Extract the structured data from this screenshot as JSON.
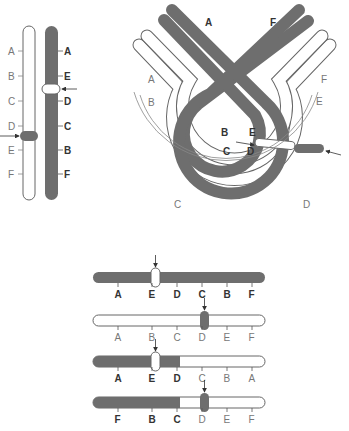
{
  "colors": {
    "dark": "#6e6e6e",
    "light": "#ffffff",
    "stroke": "#555555",
    "label_light": "#888888",
    "label_dark": "#2f2f2f"
  },
  "panel_vertical": {
    "light_chromosome_labels": [
      "A",
      "B",
      "C",
      "D",
      "E",
      "F"
    ],
    "dark_chromosome_labels": [
      "A",
      "E",
      "D",
      "C",
      "B",
      "F"
    ],
    "light_centromere_after": "D",
    "dark_centromere_after": "E"
  },
  "panel_loop": {
    "outer_labels_left": [
      "A",
      "B",
      "C"
    ],
    "outer_labels_right": [
      "F",
      "E",
      "D"
    ],
    "dark_top_labels": [
      "A",
      "F"
    ],
    "inner_loop_labels": [
      "B",
      "E",
      "C",
      "D"
    ]
  },
  "panel_bars": [
    {
      "labels": [
        "A",
        "E",
        "D",
        "C",
        "B",
        "F"
      ],
      "type": "dark",
      "label_style": [
        "b",
        "b",
        "b",
        "b",
        "b",
        "b"
      ]
    },
    {
      "labels": [
        "A",
        "B",
        "C",
        "D",
        "E",
        "F"
      ],
      "type": "light",
      "label_style": [
        "l",
        "l",
        "l",
        "l",
        "l",
        "l"
      ]
    },
    {
      "labels": [
        "A",
        "E",
        "D",
        "C",
        "B",
        "A"
      ],
      "type": "recombinant-1",
      "label_style": [
        "b",
        "b",
        "b",
        "l",
        "l",
        "l"
      ]
    },
    {
      "labels": [
        "F",
        "B",
        "C",
        "D",
        "E",
        "F"
      ],
      "type": "recombinant-2",
      "label_style": [
        "b",
        "b",
        "b",
        "l",
        "l",
        "l"
      ]
    }
  ]
}
